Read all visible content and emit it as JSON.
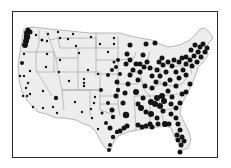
{
  "map": {
    "type": "proportional-symbol-dot-map",
    "region": "Contiguous United States",
    "colors": {
      "land": "#ededed",
      "state_border": "#8a8a8a",
      "dot": "#141414",
      "frame": "#2a2a2a",
      "background": "#ffffff"
    },
    "legend": null,
    "title": null,
    "dots": [
      {
        "x": 27,
        "y": 33,
        "r": 3
      },
      {
        "x": 27,
        "y": 37,
        "r": 3.2
      },
      {
        "x": 26,
        "y": 41,
        "r": 3
      },
      {
        "x": 25,
        "y": 45,
        "r": 3
      },
      {
        "x": 28,
        "y": 30,
        "r": 2.5
      },
      {
        "x": 30,
        "y": 32,
        "r": 2.5
      },
      {
        "x": 36,
        "y": 35,
        "r": 1.2
      },
      {
        "x": 42,
        "y": 40,
        "r": 1.5
      },
      {
        "x": 47,
        "y": 41,
        "r": 1.2
      },
      {
        "x": 48,
        "y": 34,
        "r": 1.2
      },
      {
        "x": 58,
        "y": 32,
        "r": 1.2
      },
      {
        "x": 60,
        "y": 38,
        "r": 1.2
      },
      {
        "x": 73,
        "y": 34,
        "r": 1.2
      },
      {
        "x": 68,
        "y": 39,
        "r": 1.2
      },
      {
        "x": 24,
        "y": 54,
        "r": 1.2
      },
      {
        "x": 47,
        "y": 54,
        "r": 1.2
      },
      {
        "x": 60,
        "y": 60,
        "r": 1.2
      },
      {
        "x": 79,
        "y": 53,
        "r": 1.2
      },
      {
        "x": 76,
        "y": 46,
        "r": 1.2
      },
      {
        "x": 91,
        "y": 37,
        "r": 1.2
      },
      {
        "x": 100,
        "y": 44,
        "r": 1.2
      },
      {
        "x": 114,
        "y": 38,
        "r": 1.2
      },
      {
        "x": 114,
        "y": 44,
        "r": 1.2
      },
      {
        "x": 108,
        "y": 52,
        "r": 1.2
      },
      {
        "x": 22,
        "y": 63,
        "r": 2
      },
      {
        "x": 30,
        "y": 71,
        "r": 1.2
      },
      {
        "x": 24,
        "y": 76,
        "r": 1.2
      },
      {
        "x": 20,
        "y": 76,
        "r": 1.2
      },
      {
        "x": 28,
        "y": 83,
        "r": 1.2
      },
      {
        "x": 26,
        "y": 88,
        "r": 1.2
      },
      {
        "x": 23,
        "y": 96,
        "r": 1.2
      },
      {
        "x": 27,
        "y": 96,
        "r": 1.2
      },
      {
        "x": 30,
        "y": 94,
        "r": 1.2
      },
      {
        "x": 33,
        "y": 107,
        "r": 1.2
      },
      {
        "x": 43,
        "y": 91,
        "r": 1.2
      },
      {
        "x": 46,
        "y": 67,
        "r": 1.2
      },
      {
        "x": 59,
        "y": 72,
        "r": 1.2
      },
      {
        "x": 69,
        "y": 81,
        "r": 1.2
      },
      {
        "x": 84,
        "y": 79,
        "r": 1.2
      },
      {
        "x": 84,
        "y": 83,
        "r": 1.2
      },
      {
        "x": 84,
        "y": 86,
        "r": 1.2
      },
      {
        "x": 88,
        "y": 70,
        "r": 1.2
      },
      {
        "x": 98,
        "y": 74,
        "r": 1.2
      },
      {
        "x": 56,
        "y": 98,
        "r": 2.2
      },
      {
        "x": 53,
        "y": 107,
        "r": 1.2
      },
      {
        "x": 57,
        "y": 113,
        "r": 1.2
      },
      {
        "x": 43,
        "y": 108,
        "r": 1.2
      },
      {
        "x": 75,
        "y": 102,
        "r": 1.2
      },
      {
        "x": 82,
        "y": 112,
        "r": 1.2
      },
      {
        "x": 91,
        "y": 109,
        "r": 1.2
      },
      {
        "x": 94,
        "y": 103,
        "r": 1.2
      },
      {
        "x": 95,
        "y": 97,
        "r": 1.2
      },
      {
        "x": 92,
        "y": 118,
        "r": 1.2
      },
      {
        "x": 98,
        "y": 129,
        "r": 1.2
      },
      {
        "x": 101,
        "y": 90,
        "r": 2
      },
      {
        "x": 108,
        "y": 75,
        "r": 2
      },
      {
        "x": 112,
        "y": 70,
        "r": 2
      },
      {
        "x": 116,
        "y": 67,
        "r": 2
      },
      {
        "x": 118,
        "y": 60,
        "r": 2
      },
      {
        "x": 114,
        "y": 62,
        "r": 1.5
      },
      {
        "x": 120,
        "y": 74,
        "r": 2
      },
      {
        "x": 117,
        "y": 82,
        "r": 2.5
      },
      {
        "x": 118,
        "y": 90,
        "r": 2.2
      },
      {
        "x": 116,
        "y": 96,
        "r": 2.5
      },
      {
        "x": 108,
        "y": 103,
        "r": 2
      },
      {
        "x": 112,
        "y": 110,
        "r": 2.5
      },
      {
        "x": 106,
        "y": 123,
        "r": 2
      },
      {
        "x": 110,
        "y": 128,
        "r": 2.5
      },
      {
        "x": 113,
        "y": 137,
        "r": 2.2
      },
      {
        "x": 110,
        "y": 145,
        "r": 2
      },
      {
        "x": 109,
        "y": 150,
        "r": 2
      },
      {
        "x": 117,
        "y": 132,
        "r": 2.2
      },
      {
        "x": 120,
        "y": 131,
        "r": 2.5
      },
      {
        "x": 124,
        "y": 128,
        "r": 2.5
      },
      {
        "x": 127,
        "y": 126,
        "r": 2.5
      },
      {
        "x": 126,
        "y": 115,
        "r": 3.2
      },
      {
        "x": 123,
        "y": 103,
        "r": 2.5
      },
      {
        "x": 125,
        "y": 93,
        "r": 2.5
      },
      {
        "x": 128,
        "y": 84,
        "r": 2.5
      },
      {
        "x": 130,
        "y": 75,
        "r": 2.5
      },
      {
        "x": 133,
        "y": 70,
        "r": 2.5
      },
      {
        "x": 126,
        "y": 64,
        "r": 2.5
      },
      {
        "x": 130,
        "y": 60,
        "r": 2.5
      },
      {
        "x": 127,
        "y": 54,
        "r": 2.5
      },
      {
        "x": 130,
        "y": 45,
        "r": 2.5
      },
      {
        "x": 146,
        "y": 44,
        "r": 2.5
      },
      {
        "x": 155,
        "y": 43,
        "r": 2.5
      },
      {
        "x": 143,
        "y": 55,
        "r": 2.5
      },
      {
        "x": 147,
        "y": 62,
        "r": 2.5
      },
      {
        "x": 150,
        "y": 68,
        "r": 2.5
      },
      {
        "x": 144,
        "y": 67,
        "r": 2.5
      },
      {
        "x": 140,
        "y": 64,
        "r": 2.5
      },
      {
        "x": 136,
        "y": 64,
        "r": 2.5
      },
      {
        "x": 140,
        "y": 72,
        "r": 2.5
      },
      {
        "x": 138,
        "y": 80,
        "r": 2.5
      },
      {
        "x": 145,
        "y": 86,
        "r": 2.5
      },
      {
        "x": 136,
        "y": 92,
        "r": 3
      },
      {
        "x": 143,
        "y": 98,
        "r": 2.5
      },
      {
        "x": 138,
        "y": 104,
        "r": 2.5
      },
      {
        "x": 141,
        "y": 108,
        "r": 3
      },
      {
        "x": 146,
        "y": 112,
        "r": 2.5
      },
      {
        "x": 151,
        "y": 114,
        "r": 3
      },
      {
        "x": 157,
        "y": 118,
        "r": 2.5
      },
      {
        "x": 151,
        "y": 102,
        "r": 3
      },
      {
        "x": 155,
        "y": 104,
        "r": 3
      },
      {
        "x": 160,
        "y": 106,
        "r": 3
      },
      {
        "x": 157,
        "y": 98,
        "r": 3
      },
      {
        "x": 162,
        "y": 96,
        "r": 3
      },
      {
        "x": 164,
        "y": 101,
        "r": 3
      },
      {
        "x": 163,
        "y": 111,
        "r": 2.5
      },
      {
        "x": 152,
        "y": 88,
        "r": 2.5
      },
      {
        "x": 156,
        "y": 82,
        "r": 2.5
      },
      {
        "x": 152,
        "y": 76,
        "r": 2.5
      },
      {
        "x": 157,
        "y": 70,
        "r": 2.5
      },
      {
        "x": 160,
        "y": 76,
        "r": 2.5
      },
      {
        "x": 165,
        "y": 84,
        "r": 2.5
      },
      {
        "x": 168,
        "y": 91,
        "r": 2.5
      },
      {
        "x": 172,
        "y": 97,
        "r": 2.5
      },
      {
        "x": 171,
        "y": 104,
        "r": 2.5
      },
      {
        "x": 176,
        "y": 108,
        "r": 2.5
      },
      {
        "x": 180,
        "y": 103,
        "r": 2.5
      },
      {
        "x": 182,
        "y": 94,
        "r": 2.5
      },
      {
        "x": 176,
        "y": 86,
        "r": 2.5
      },
      {
        "x": 170,
        "y": 80,
        "r": 2.5
      },
      {
        "x": 166,
        "y": 72,
        "r": 2.5
      },
      {
        "x": 163,
        "y": 65,
        "r": 2.5
      },
      {
        "x": 159,
        "y": 62,
        "r": 2.5
      },
      {
        "x": 162,
        "y": 58,
        "r": 2.5
      },
      {
        "x": 168,
        "y": 62,
        "r": 2.5
      },
      {
        "x": 172,
        "y": 66,
        "r": 2.5
      },
      {
        "x": 174,
        "y": 60,
        "r": 2.5
      },
      {
        "x": 176,
        "y": 72,
        "r": 2.5
      },
      {
        "x": 179,
        "y": 78,
        "r": 2.5
      },
      {
        "x": 183,
        "y": 70,
        "r": 2.5
      },
      {
        "x": 186,
        "y": 64,
        "r": 2.5
      },
      {
        "x": 190,
        "y": 60,
        "r": 2.5
      },
      {
        "x": 194,
        "y": 56,
        "r": 2.5
      },
      {
        "x": 198,
        "y": 52,
        "r": 2.5
      },
      {
        "x": 200,
        "y": 47,
        "r": 2.5
      },
      {
        "x": 203,
        "y": 44,
        "r": 2.5
      },
      {
        "x": 195,
        "y": 45,
        "r": 2.5
      },
      {
        "x": 191,
        "y": 50,
        "r": 2.5
      },
      {
        "x": 186,
        "y": 57,
        "r": 2.5
      },
      {
        "x": 182,
        "y": 58,
        "r": 2.5
      },
      {
        "x": 179,
        "y": 62,
        "r": 2.5
      },
      {
        "x": 186,
        "y": 75,
        "r": 2.5
      },
      {
        "x": 190,
        "y": 84,
        "r": 2.5
      },
      {
        "x": 186,
        "y": 92,
        "r": 2.5
      },
      {
        "x": 192,
        "y": 66,
        "r": 2.5
      },
      {
        "x": 197,
        "y": 62,
        "r": 2.5
      },
      {
        "x": 201,
        "y": 57,
        "r": 2.5
      },
      {
        "x": 205,
        "y": 52,
        "r": 2.5
      },
      {
        "x": 207,
        "y": 48,
        "r": 2.5
      },
      {
        "x": 169,
        "y": 124,
        "r": 2.5
      },
      {
        "x": 176,
        "y": 118,
        "r": 2.5
      },
      {
        "x": 178,
        "y": 124,
        "r": 2.5
      },
      {
        "x": 180,
        "y": 130,
        "r": 2.5
      },
      {
        "x": 177,
        "y": 135,
        "r": 2.5
      },
      {
        "x": 182,
        "y": 137,
        "r": 2.5
      },
      {
        "x": 184,
        "y": 141,
        "r": 2.5
      },
      {
        "x": 181,
        "y": 145,
        "r": 2.5
      },
      {
        "x": 178,
        "y": 140,
        "r": 2.5
      },
      {
        "x": 180,
        "y": 152,
        "r": 2.5
      },
      {
        "x": 138,
        "y": 125,
        "r": 2.5
      },
      {
        "x": 142,
        "y": 127,
        "r": 2.5
      },
      {
        "x": 146,
        "y": 126,
        "r": 2.5
      },
      {
        "x": 150,
        "y": 124,
        "r": 2.5
      },
      {
        "x": 152,
        "y": 127,
        "r": 2.5
      },
      {
        "x": 158,
        "y": 124,
        "r": 2.5
      },
      {
        "x": 165,
        "y": 124,
        "r": 3
      },
      {
        "x": 171,
        "y": 114,
        "r": 2.5
      },
      {
        "x": 113,
        "y": 117,
        "r": 2.2
      },
      {
        "x": 102,
        "y": 113,
        "r": 1.5
      }
    ]
  }
}
